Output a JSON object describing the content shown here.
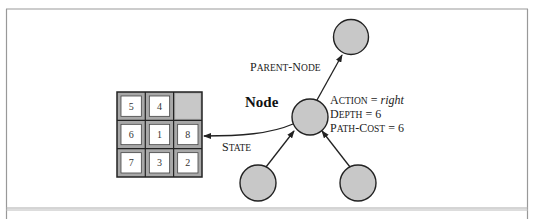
{
  "diagram": {
    "node_label": "Node",
    "state_label": {
      "first": "S",
      "rest": "TATE"
    },
    "parent_label": {
      "p1": "P",
      "p1rest": "ARENT",
      "dash": "-",
      "p2": "N",
      "p2rest": "ODE"
    },
    "fields": [
      {
        "sc_first": "A",
        "sc_rest": "CTION",
        "eq": " = ",
        "value": "right",
        "italic": true
      },
      {
        "sc_first": "D",
        "sc_rest": "EPTH",
        "eq": " = ",
        "value": "6",
        "italic": false
      },
      {
        "sc_first": "P",
        "sc_rest": "ATH",
        "dash": "-",
        "sc2_first": "C",
        "sc2_rest": "OST",
        "eq": " = ",
        "value": "6",
        "italic": false
      }
    ],
    "puzzle": {
      "tiles": [
        [
          "5",
          "4",
          ""
        ],
        [
          "6",
          "1",
          "8"
        ],
        [
          "7",
          "3",
          "2"
        ]
      ],
      "blank_color": "#c8c8c8",
      "frame_color": "#a8a8a8"
    },
    "colors": {
      "node_fill": "#c8c8c8",
      "node_stroke": "#222222",
      "frame": "#999999"
    }
  }
}
